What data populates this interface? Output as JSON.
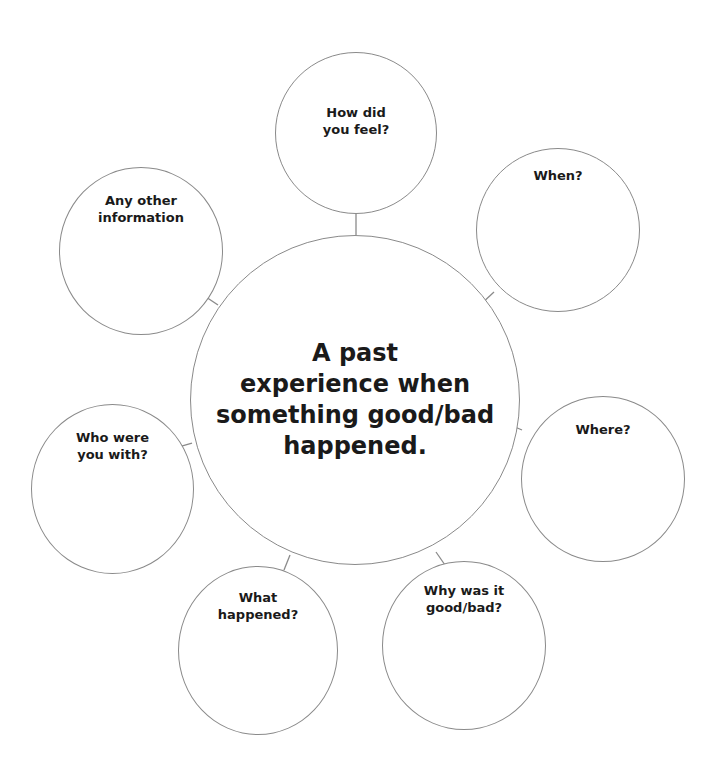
{
  "central_topic": "A past experience when something good/bad happened.",
  "central_lines": [
    "A past",
    "experience when",
    "something good/bad",
    "happened."
  ],
  "nodes": [
    {
      "id": "how-did-you-feel",
      "lines": [
        "How did",
        "you feel?"
      ]
    },
    {
      "id": "when",
      "lines": [
        "When?"
      ]
    },
    {
      "id": "where",
      "lines": [
        "Where?"
      ]
    },
    {
      "id": "why-good-bad",
      "lines": [
        "Why was it",
        "good/bad?"
      ]
    },
    {
      "id": "what-happened",
      "lines": [
        "What",
        "happened?"
      ]
    },
    {
      "id": "who-with",
      "lines": [
        "Who were",
        "you with?"
      ]
    },
    {
      "id": "other-info",
      "lines": [
        "Any other",
        "information"
      ]
    }
  ],
  "colors": {
    "stroke": "#8a8a8a",
    "text": "#1a1a1a",
    "background": "#ffffff"
  }
}
